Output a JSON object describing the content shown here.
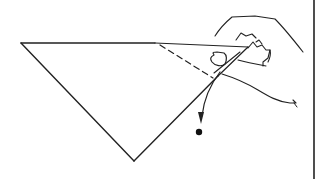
{
  "figure": {
    "description": "Line drawing of a hand folding a corner of a triangular paper; dashed fold line and arrow pointing down to a dot",
    "colors": {
      "ink": "#222222",
      "background": "#ffffff"
    },
    "triangle": {
      "vertices": [
        [
          21,
          43
        ],
        [
          248,
          47
        ],
        [
          134,
          161
        ]
      ]
    },
    "fold_line": {
      "style": "dashed",
      "from": [
        160,
        45
      ],
      "to": [
        213,
        78
      ]
    },
    "arrow": {
      "from": [
        220,
        72
      ],
      "to": [
        201,
        121
      ],
      "direction": "down"
    },
    "target_dot": {
      "center": [
        199,
        132
      ],
      "radius": 3
    },
    "right_border_x": 314
  }
}
